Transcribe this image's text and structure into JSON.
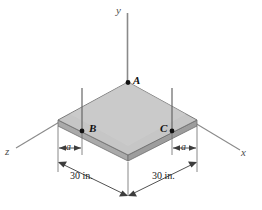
{
  "figure": {
    "axes": {
      "y_label": "y",
      "x_label": "x",
      "z_label": "z"
    },
    "points": {
      "A": "A",
      "B": "B",
      "C": "C"
    },
    "dimensions": {
      "a_left": "a",
      "a_right": "a",
      "span_left": "30 in.",
      "span_right": "30 in."
    },
    "colors": {
      "plate_top": "#c3c3c3",
      "plate_edge": "#a8a8a8",
      "plate_side": "#b0b0b0",
      "line": "#555555",
      "axis": "#777777",
      "point": "#111111"
    }
  }
}
